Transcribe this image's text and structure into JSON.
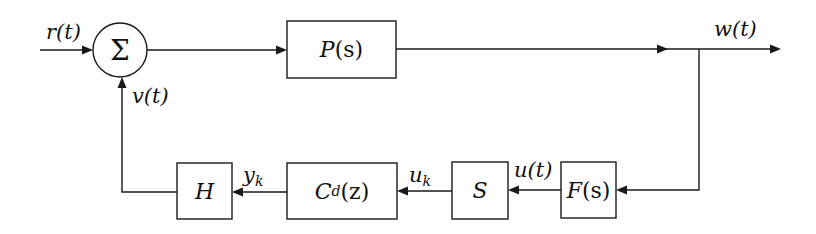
{
  "diagram": {
    "type": "feedback-control-block-diagram",
    "summing_junction": {
      "symbol": "Σ",
      "inputs": [
        "r(t)",
        "v(t)"
      ]
    },
    "blocks": {
      "plant": {
        "name": "P",
        "arg": "(s)"
      },
      "filter": {
        "name": "F",
        "arg": "(s)"
      },
      "sampler": {
        "name": "S"
      },
      "controller": {
        "name": "C",
        "sub": "d",
        "arg": "(z)"
      },
      "hold": {
        "name": "H"
      }
    },
    "signals": {
      "input": "r(t)",
      "output": "w(t)",
      "feedback": "v(t)",
      "filtered": "u(t)",
      "sampled_name": "u",
      "sampled_sub": "k",
      "controller_out_name": "y",
      "controller_out_sub": "k"
    },
    "colors": {
      "line": "#1a1a1a",
      "background": "#ffffff"
    }
  }
}
